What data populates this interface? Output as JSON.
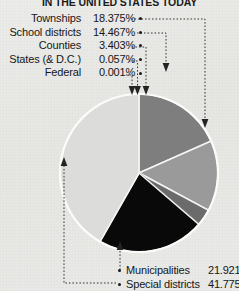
{
  "chart_title": "IN THE UNITED STATES TODAY",
  "chart_data": {
    "type": "pie",
    "title": "IN THE UNITED STATES TODAY",
    "xlabel": "",
    "ylabel": "",
    "legend_position": "callout-labels",
    "grid": false,
    "units": "percent",
    "categories": [
      "Townships",
      "School districts",
      "Counties",
      "States (& D.C.)",
      "Federal",
      "Municipalities",
      "Special districts"
    ],
    "values": [
      18.375,
      14.467,
      3.403,
      0.057,
      0.001,
      21.921,
      41.775
    ],
    "slices": [
      {
        "label": "Townships",
        "value": 18.375,
        "display": "18.375%",
        "color": "#7e7e7e"
      },
      {
        "label": "School districts",
        "value": 14.467,
        "display": "14.467%",
        "color": "#9a9a9a"
      },
      {
        "label": "Counties",
        "value": 3.403,
        "display": "3.403%",
        "color": "#6b6b6b"
      },
      {
        "label": "States (& D.C.)",
        "value": 0.057,
        "display": "0.057%",
        "color": "#4a4a4a"
      },
      {
        "label": "Federal",
        "value": 0.001,
        "display": "0.001%",
        "color": "#2a2a2a"
      },
      {
        "label": "Municipalities",
        "value": 21.921,
        "display": "21.921%",
        "color": "#090909"
      },
      {
        "label": "Special districts",
        "value": 41.775,
        "display": "41.775%",
        "color": "#dcdcda"
      }
    ]
  },
  "left_labels": [
    {
      "name": "Townships",
      "value": "18.375%"
    },
    {
      "name": "School districts",
      "value": "14.467%"
    },
    {
      "name": "Counties",
      "value": "3.403%"
    },
    {
      "name": "States (& D.C.)",
      "value": "0.057%"
    },
    {
      "name": "Federal",
      "value": "0.001%"
    }
  ],
  "bottom_legend": [
    {
      "name": "Municipalities",
      "value": "21.921%"
    },
    {
      "name": "Special districts",
      "value": "41.775%"
    }
  ],
  "colors": {
    "background": "#e8e8e6",
    "text": "#171717",
    "leader": "#232323",
    "slice_divider": "#f4f4f2"
  }
}
